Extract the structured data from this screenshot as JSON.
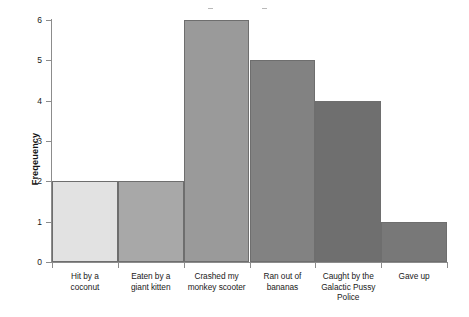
{
  "chart_data": {
    "type": "bar",
    "title": "",
    "xlabel": "",
    "ylabel": "Freqeuency",
    "categories": [
      "Hit by a coconut",
      "Eaten by a giant kitten",
      "Crashed my monkey scooter",
      "Ran out of bananas",
      "Caught by the Galactic Pussy Police",
      "Gave up"
    ],
    "values": [
      2,
      2,
      6,
      5,
      4,
      1
    ],
    "ylim": [
      0,
      6
    ],
    "yticks": [
      0,
      1,
      2,
      3,
      4,
      5,
      6
    ],
    "ytick_labels": [
      "0",
      "1",
      "2",
      "3",
      "4",
      "5",
      "6"
    ],
    "grid": false,
    "legend": null,
    "bar_colors": [
      "#e2e2e2",
      "#a8a8a8",
      "#9a9a9a",
      "#828282",
      "#6f6f6f",
      "#787878"
    ],
    "bar_edge_color": "#6e6e6e",
    "axis_color": "#8c8c8c",
    "background_color": "#ffffff",
    "text_color": "#1a1a1a"
  },
  "axis": {
    "y_title": "Freqeuency",
    "y_ticks": [
      {
        "label": "6",
        "value": 6
      },
      {
        "label": "5",
        "value": 5
      },
      {
        "label": "4",
        "value": 4
      },
      {
        "label": "3",
        "value": 3
      },
      {
        "label": "2",
        "value": 2
      },
      {
        "label": "1",
        "value": 1
      },
      {
        "label": "0",
        "value": 0
      }
    ]
  },
  "bars": [
    {
      "label": "Hit by a coconut",
      "label_lines": [
        "Hit by a",
        "coconut"
      ],
      "value": 2,
      "color": "#e2e2e2"
    },
    {
      "label": "Eaten by a giant kitten",
      "label_lines": [
        "Eaten by a",
        "giant kitten"
      ],
      "value": 2,
      "color": "#a8a8a8"
    },
    {
      "label": "Crashed my monkey scooter",
      "label_lines": [
        "Crashed my",
        "monkey scooter"
      ],
      "value": 6,
      "color": "#9a9a9a"
    },
    {
      "label": "Ran out of bananas",
      "label_lines": [
        "Ran out of",
        "bananas"
      ],
      "value": 5,
      "color": "#828282"
    },
    {
      "label": "Caught by the Galactic Pussy Police",
      "label_lines": [
        "Caught by the",
        "Galactic Pussy",
        "Police"
      ],
      "value": 4,
      "color": "#6f6f6f"
    },
    {
      "label": "Gave up",
      "label_lines": [
        "Gave up"
      ],
      "value": 1,
      "color": "#787878"
    }
  ]
}
